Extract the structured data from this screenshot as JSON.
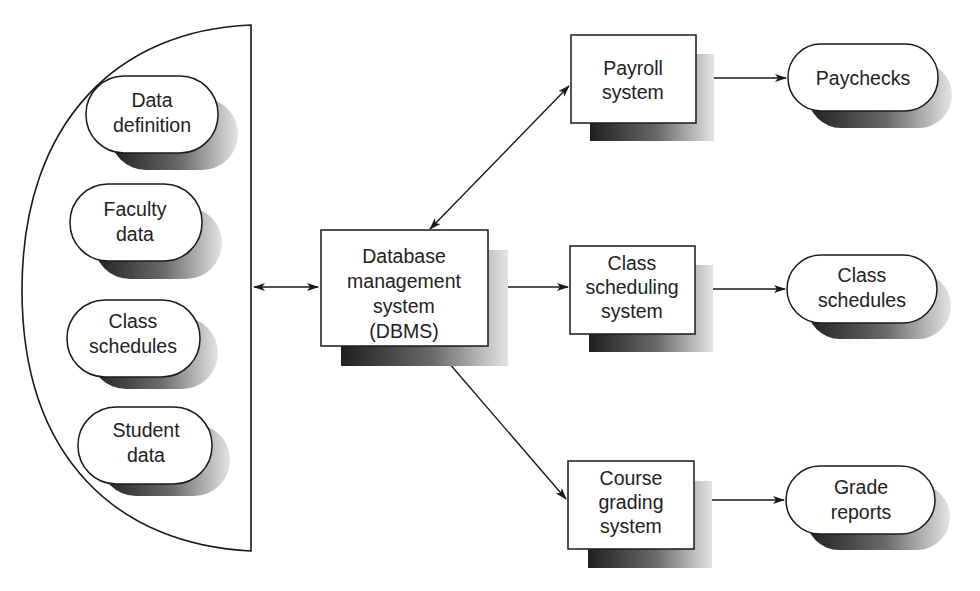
{
  "diagram": {
    "type": "flowchart",
    "colors": {
      "line": "#1a1a1a",
      "fill": "#ffffff",
      "shadow_dark": "#2a2a2a",
      "shadow_light": "#d8d8d8",
      "text": "#222222"
    },
    "data_store": {
      "name": "database",
      "items": [
        {
          "id": "data-definition",
          "lines": [
            "Data",
            "definition"
          ]
        },
        {
          "id": "faculty-data",
          "lines": [
            "Faculty",
            "data"
          ]
        },
        {
          "id": "class-schedules-data",
          "lines": [
            "Class",
            "schedules"
          ]
        },
        {
          "id": "student-data",
          "lines": [
            "Student",
            "data"
          ]
        }
      ]
    },
    "dbms": {
      "id": "dbms",
      "lines": [
        "Database",
        "management",
        "system",
        "(DBMS)"
      ]
    },
    "systems": [
      {
        "id": "payroll-system",
        "lines": [
          "Payroll",
          "system"
        ]
      },
      {
        "id": "class-scheduling-system",
        "lines": [
          "Class",
          "scheduling",
          "system"
        ]
      },
      {
        "id": "course-grading-system",
        "lines": [
          "Course",
          "grading",
          "system"
        ]
      }
    ],
    "outputs": [
      {
        "id": "paychecks",
        "lines": [
          "Paychecks"
        ]
      },
      {
        "id": "class-schedules-output",
        "lines": [
          "Class",
          "schedules"
        ]
      },
      {
        "id": "grade-reports",
        "lines": [
          "Grade",
          "reports"
        ]
      }
    ],
    "edges": [
      {
        "from": "database",
        "to": "dbms",
        "direction": "both"
      },
      {
        "from": "dbms",
        "to": "payroll-system",
        "direction": "both"
      },
      {
        "from": "dbms",
        "to": "class-scheduling-system",
        "direction": "both"
      },
      {
        "from": "dbms",
        "to": "course-grading-system",
        "direction": "both"
      },
      {
        "from": "payroll-system",
        "to": "paychecks",
        "direction": "forward"
      },
      {
        "from": "class-scheduling-system",
        "to": "class-schedules-output",
        "direction": "forward"
      },
      {
        "from": "course-grading-system",
        "to": "grade-reports",
        "direction": "forward"
      }
    ]
  }
}
